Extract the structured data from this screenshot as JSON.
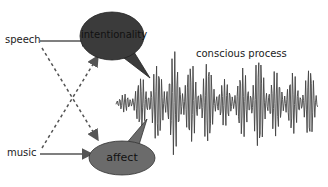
{
  "diagram": {
    "inputs": {
      "speech": "speech",
      "music": "music"
    },
    "bubbles": {
      "intentionality": {
        "label": "intentionality",
        "fill": "#3b3b3b"
      },
      "affect": {
        "label": "affect",
        "fill": "#6b6b6b"
      }
    },
    "process_label": "conscious process",
    "colors": {
      "arrow": "#555555",
      "wave": "#444444",
      "text": "#222222"
    }
  }
}
